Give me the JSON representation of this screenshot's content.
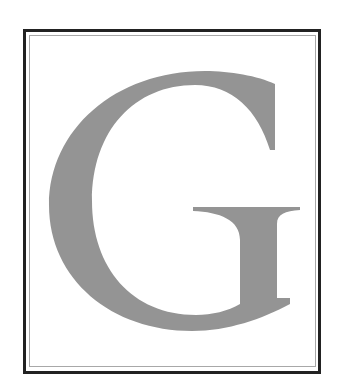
{
  "figure": {
    "letter": "G",
    "letter_color": "#949494",
    "frame_outer_color": "#222222",
    "frame_inner_color": "#a8a8a8",
    "background_color": "#ffffff"
  }
}
